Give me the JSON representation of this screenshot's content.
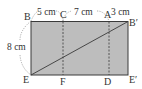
{
  "diagram": {
    "type": "folded-rectangle-geometry",
    "colors": {
      "fill": "#bdbdbd",
      "stroke": "#3a3a3a",
      "dashed": "#666666",
      "text": "#333333",
      "background": "#ffffff"
    },
    "points": {
      "B": "B",
      "C": "C",
      "A": "A",
      "B_prime": "B′",
      "E": "E",
      "F": "F",
      "D": "D",
      "E_prime": "E′"
    },
    "measurements": {
      "BC": "5 cm",
      "CA": "7 cm",
      "AB_prime": "3 cm",
      "BE": "8 cm"
    },
    "segments": [
      {
        "from": "E",
        "to": "B′",
        "style": "solid",
        "role": "diagonal"
      },
      {
        "from": "C",
        "to": "F",
        "style": "dashed",
        "role": "fold-line"
      },
      {
        "from": "A",
        "to": "D",
        "style": "dashed",
        "role": "fold-line"
      }
    ]
  }
}
